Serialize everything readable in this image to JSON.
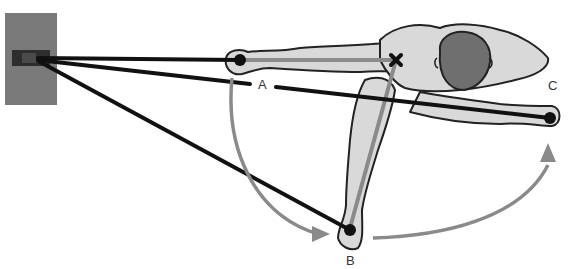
{
  "diagram": {
    "type": "biomechanics-cable-pull-top-view",
    "labels": {
      "a": "A",
      "b": "B",
      "c": "C"
    },
    "elements": {
      "wall_anchor": "cable-anchor-box",
      "pivot_marker": "shoulder-pivot-x",
      "positions": [
        "A",
        "B",
        "C"
      ]
    },
    "colors": {
      "anchor_box": "#7a7a7a",
      "anchor_slot": "#2e2e2e",
      "body_fill": "#d9d9d9",
      "outline": "#222222",
      "head": "#6f6f6f",
      "cable": "#111111",
      "arc_arrow": "#8a8a8a",
      "lever_line": "#8a8a8a"
    }
  }
}
